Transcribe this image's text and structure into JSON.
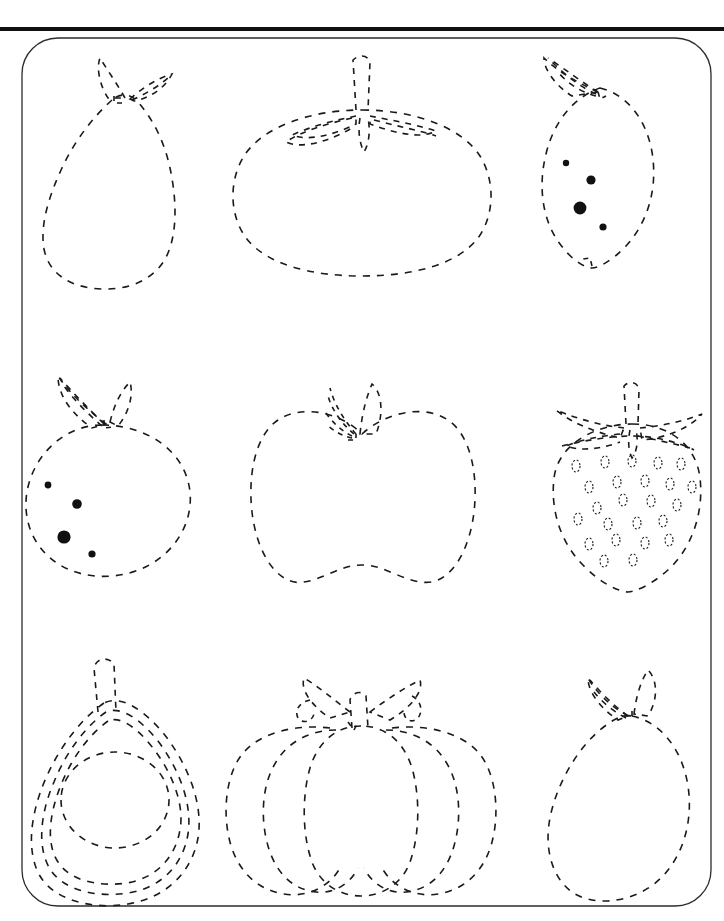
{
  "page": {
    "width": 724,
    "height": 921,
    "background_color": "#ffffff",
    "ink_color": "#1a1a1a",
    "border_color": "#2b2b2b",
    "top_rule": {
      "x": 0,
      "y": 27,
      "width": 724,
      "height": 4,
      "color": "#111111"
    },
    "frame": {
      "x": 22,
      "y": 38,
      "width": 689,
      "height": 868,
      "radius": 36
    }
  },
  "legend": {
    "style": "dashed outline tracing",
    "dash_pattern": "7 7",
    "stroke_width": 1.6
  },
  "grid": {
    "rows": 3,
    "cols": 3,
    "count": 9
  },
  "items": [
    {
      "row": 0,
      "col": 0,
      "name": "pear",
      "label": "Pear",
      "has_dots": false,
      "outlines": 1
    },
    {
      "row": 0,
      "col": 1,
      "name": "tomato",
      "label": "Tomato",
      "has_dots": false,
      "outlines": 1
    },
    {
      "row": 0,
      "col": 2,
      "name": "lemon",
      "label": "Lemon",
      "has_dots": true,
      "dot_count": 4,
      "outlines": 1
    },
    {
      "row": 1,
      "col": 0,
      "name": "orange",
      "label": "Orange",
      "has_dots": true,
      "dot_count": 4,
      "outlines": 1
    },
    {
      "row": 1,
      "col": 1,
      "name": "apple",
      "label": "Apple",
      "has_dots": false,
      "outlines": 1
    },
    {
      "row": 1,
      "col": 2,
      "name": "strawberry",
      "label": "Strawberry",
      "has_dots": true,
      "dot_count": 24,
      "seed_style": "dashed-ellipse",
      "outlines": 1
    },
    {
      "row": 2,
      "col": 0,
      "name": "pear-spiral",
      "label": "Pear (layered)",
      "has_dots": false,
      "outlines": 3
    },
    {
      "row": 2,
      "col": 1,
      "name": "pumpkin",
      "label": "Pumpkin",
      "has_dots": false,
      "outlines": 3
    },
    {
      "row": 2,
      "col": 2,
      "name": "mango",
      "label": "Mango",
      "has_dots": false,
      "outlines": 1
    }
  ],
  "dots": {
    "lemon": [
      {
        "cx": 566,
        "cy": 163,
        "r": 3.2
      },
      {
        "cx": 591,
        "cy": 180,
        "r": 4.6
      },
      {
        "cx": 580,
        "cy": 208,
        "r": 6.4
      },
      {
        "cx": 603,
        "cy": 227,
        "r": 3.6
      }
    ],
    "orange": [
      {
        "cx": 48,
        "cy": 485,
        "r": 3.4
      },
      {
        "cx": 77,
        "cy": 504,
        "r": 4.8
      },
      {
        "cx": 64,
        "cy": 537,
        "r": 6.6
      },
      {
        "cx": 92,
        "cy": 554,
        "r": 3.6
      }
    ],
    "strawberry_seeds": [
      {
        "cx": 576,
        "cy": 466
      },
      {
        "cx": 605,
        "cy": 462
      },
      {
        "cx": 632,
        "cy": 461
      },
      {
        "cx": 658,
        "cy": 463
      },
      {
        "cx": 681,
        "cy": 464
      },
      {
        "cx": 589,
        "cy": 487
      },
      {
        "cx": 617,
        "cy": 482
      },
      {
        "cx": 645,
        "cy": 481
      },
      {
        "cx": 670,
        "cy": 484
      },
      {
        "cx": 692,
        "cy": 487
      },
      {
        "cx": 597,
        "cy": 508
      },
      {
        "cx": 623,
        "cy": 500
      },
      {
        "cx": 651,
        "cy": 501
      },
      {
        "cx": 677,
        "cy": 505
      },
      {
        "cx": 578,
        "cy": 519
      },
      {
        "cx": 608,
        "cy": 524
      },
      {
        "cx": 637,
        "cy": 523
      },
      {
        "cx": 663,
        "cy": 521
      },
      {
        "cx": 589,
        "cy": 544
      },
      {
        "cx": 616,
        "cy": 540
      },
      {
        "cx": 645,
        "cy": 543
      },
      {
        "cx": 669,
        "cy": 540
      },
      {
        "cx": 604,
        "cy": 561
      },
      {
        "cx": 633,
        "cy": 560
      }
    ]
  }
}
